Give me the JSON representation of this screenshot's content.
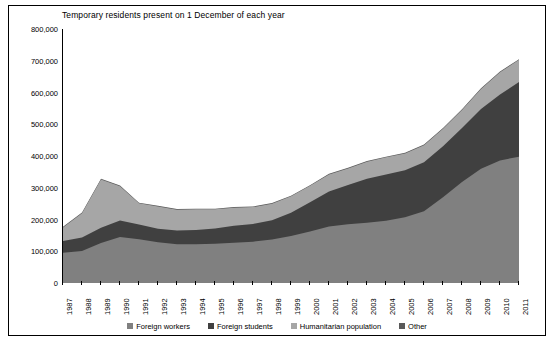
{
  "chart_data": {
    "type": "area",
    "title": "Temporary residents present on 1 December of each year",
    "xlabel": "",
    "ylabel": "",
    "stacked": true,
    "grid": false,
    "legend_position": "bottom",
    "ylim": [
      0,
      800000
    ],
    "yticks": [
      0,
      100000,
      200000,
      300000,
      400000,
      500000,
      600000,
      700000,
      800000
    ],
    "ytick_labels": [
      "0",
      "100,000",
      "200,000",
      "300,000",
      "400,000",
      "500,000",
      "600,000",
      "700,000",
      "800,000"
    ],
    "categories": [
      "1987",
      "1988",
      "1989",
      "1990",
      "1991",
      "1992",
      "1993",
      "1994",
      "1995",
      "1996",
      "1997",
      "1998",
      "1999",
      "2000",
      "2001",
      "2002",
      "2003",
      "2004",
      "2005",
      "2006",
      "2007",
      "2008",
      "2009",
      "2010",
      "2011"
    ],
    "series": [
      {
        "name": "Foreign workers",
        "color": "#808080",
        "values": [
          95000,
          101000,
          126000,
          145000,
          138000,
          128000,
          122000,
          122000,
          124000,
          127000,
          130000,
          137000,
          148000,
          162000,
          178000,
          185000,
          190000,
          196000,
          207000,
          226000,
          270000,
          318000,
          360000,
          386000,
          398000
        ]
      },
      {
        "name": "Foreign students",
        "color": "#404040",
        "values": [
          37000,
          42000,
          48000,
          52000,
          46000,
          43000,
          43000,
          45000,
          48000,
          53000,
          56000,
          61000,
          73000,
          92000,
          110000,
          124000,
          138000,
          146000,
          148000,
          154000,
          161000,
          170000,
          188000,
          208000,
          235000
        ]
      },
      {
        "name": "Humanitarian population",
        "color": "#a6a6a6",
        "values": [
          43000,
          77000,
          152000,
          108000,
          67000,
          70000,
          66000,
          65000,
          60000,
          57000,
          53000,
          52000,
          52000,
          52000,
          54000,
          52000,
          54000,
          54000,
          53000,
          54000,
          55000,
          57000,
          63000,
          70000,
          70000
        ]
      },
      {
        "name": "Other",
        "color": "#595959",
        "values": [
          2000,
          2000,
          2000,
          2000,
          2000,
          2000,
          2000,
          2000,
          2000,
          2000,
          2000,
          2000,
          2000,
          2000,
          2000,
          2000,
          2000,
          2000,
          2000,
          2000,
          2000,
          2000,
          2000,
          2000,
          2000
        ]
      }
    ]
  },
  "legend": [
    {
      "label": "Foreign workers",
      "color": "#808080"
    },
    {
      "label": "Foreign students",
      "color": "#404040"
    },
    {
      "label": "Humanitarian population",
      "color": "#a6a6a6"
    },
    {
      "label": "Other",
      "color": "#595959"
    }
  ]
}
